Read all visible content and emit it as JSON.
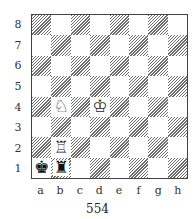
{
  "diagram": {
    "caption": "554",
    "ranks": [
      "8",
      "7",
      "6",
      "5",
      "4",
      "3",
      "2",
      "1"
    ],
    "files": [
      "a",
      "b",
      "c",
      "d",
      "e",
      "f",
      "g",
      "h"
    ],
    "dark_square_style": "hatched",
    "pieces": [
      {
        "square": "d4",
        "color": "white",
        "type": "king",
        "glyph": "♔",
        "icon": "white-king-icon"
      },
      {
        "square": "b4",
        "color": "white",
        "type": "knight",
        "glyph": "♘",
        "icon": "white-knight-icon"
      },
      {
        "square": "b2",
        "color": "white",
        "type": "rook",
        "glyph": "♖",
        "icon": "white-rook-icon"
      },
      {
        "square": "a1",
        "color": "black",
        "type": "king",
        "glyph": "♚",
        "icon": "black-king-icon"
      },
      {
        "square": "b1",
        "color": "black",
        "type": "rook",
        "glyph": "♜",
        "icon": "black-rook-icon"
      }
    ]
  }
}
